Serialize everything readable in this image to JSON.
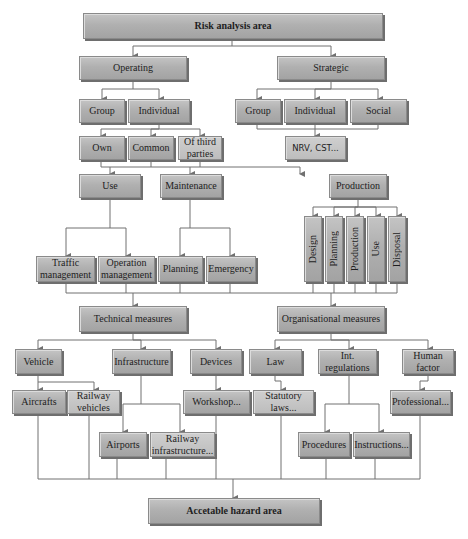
{
  "diagram": {
    "colors": {
      "box_fill": "#b3b3b3",
      "box_border": "#8a8a8a",
      "line": "#707070",
      "text": "#1e1e1e"
    },
    "top": {
      "label": "Risk analysis area"
    },
    "operating": {
      "label": "Operating",
      "group": "Group",
      "individual": "Individual",
      "own": "Own",
      "common": "Common",
      "third_parties": "Of third parties"
    },
    "strategic": {
      "label": "Strategic",
      "group": "Group",
      "individual": "Individual",
      "social": "Social",
      "nrv": "NRV, CST..."
    },
    "use": {
      "label": "Use",
      "traffic_management": "Traffic management",
      "operation_management": "Operation management"
    },
    "maintenance": {
      "label": "Maintenance",
      "planning": "Planning",
      "emergency": "Emergency"
    },
    "production": {
      "label": "Production",
      "phases": [
        "Design",
        "Planning",
        "Production",
        "Use",
        "Disposal"
      ]
    },
    "technical_measures": {
      "label": "Technical measures",
      "vehicle": "Vehicle",
      "aircrafts": "Aircrafts",
      "railway_vehicles": "Railway vehicles",
      "infrastructure": "Infrastructure",
      "airports": "Airports",
      "railway_infrastructure": "Railway infrastructure...",
      "devices": "Devices",
      "workshop": "Workshop..."
    },
    "organisational_measures": {
      "label": "Organisational measures",
      "law": "Law",
      "statutory_laws": "Statutory laws...",
      "int_regulations": "Int. regulations",
      "procedures": "Procedures",
      "instructions": "Instructions...",
      "human_factor": "Human factor",
      "professional": "Professional..."
    },
    "bottom": {
      "label": "Accetable hazard area"
    }
  }
}
